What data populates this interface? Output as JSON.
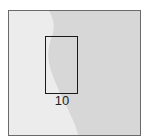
{
  "figure": {
    "panel": {
      "background_dark": "#d6d6d6",
      "background_light": "#ececec",
      "border_color": "#6a6a6a"
    },
    "roi": {
      "label": "10",
      "border_color": "#1a1a1a"
    }
  }
}
